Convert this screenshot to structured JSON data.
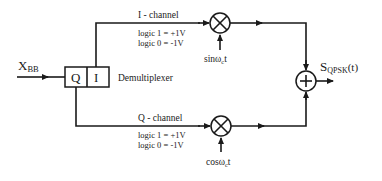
{
  "diagram": {
    "type": "QPSK modulator block diagram",
    "input": {
      "label_main": "X",
      "label_sub": "BB"
    },
    "demux": {
      "label": "Demultiplexer",
      "cells": [
        "Q",
        "I"
      ]
    },
    "i_channel": {
      "title": "I - channel",
      "logic1": "logic 1 = +1V",
      "logic0": "logic 0 = -1V",
      "carrier_main": "sin",
      "carrier_omega": "ω",
      "carrier_sub": "c",
      "carrier_t": "t"
    },
    "q_channel": {
      "title": "Q - channel",
      "logic1": "logic 1 = +1V",
      "logic0": "logic 0 = -1V",
      "carrier_main": "cos",
      "carrier_omega": "ω",
      "carrier_sub": "c",
      "carrier_t": "t"
    },
    "multiplier_symbol": "✕",
    "summer_symbol": "+",
    "output": {
      "label_main": "S",
      "label_sub": "QPSK",
      "label_arg": "(t)"
    },
    "colors": {
      "line": "#1a1a1a",
      "background": "#ffffff"
    }
  }
}
